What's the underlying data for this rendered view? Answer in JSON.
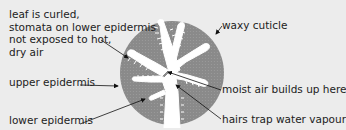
{
  "diagram": {
    "labels": {
      "curled": [
        "leaf is curled,",
        "stomata on lower epidermis",
        "not exposed to hot,",
        "dry air"
      ],
      "waxy_cuticle": "waxy cuticle",
      "upper_epidermis": "upper epidermis",
      "moist_air": "moist air builds up here",
      "lower_epidermis": "lower epidermis",
      "hairs": "hairs trap water vapour"
    },
    "colors": {
      "background": "#ececec",
      "leaf_tissue": "#8a8a8a",
      "leaf_interior": "#ffffff",
      "text": "#222222",
      "arrow": "#111111"
    }
  }
}
